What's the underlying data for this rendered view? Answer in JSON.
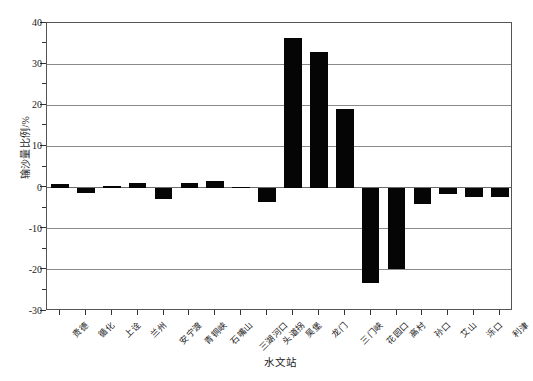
{
  "chart_data": {
    "type": "bar",
    "title": "",
    "xlabel": "水文站",
    "ylabel": "输沙量比例/%",
    "ylim": [
      -30,
      40
    ],
    "yticks": [
      -30,
      -20,
      -10,
      0,
      10,
      20,
      30,
      40
    ],
    "ytick_labels": [
      "-30",
      "-20",
      "-10",
      "0",
      "10",
      "20",
      "30",
      "40"
    ],
    "yminor_step": 5,
    "grid": "horizontal",
    "legend": "none",
    "bar_color": "#050505",
    "categories": [
      "贵德",
      "循化",
      "上诠",
      "兰州",
      "安宁渡",
      "青铜峡",
      "石嘴山",
      "三湖河口",
      "头道拐",
      "吴堡",
      "龙门",
      "三门峡",
      "花园口",
      "高村",
      "孙口",
      "艾山",
      "泺口",
      "利津"
    ],
    "values": [
      0.8,
      -1.4,
      0.5,
      1.0,
      -2.8,
      1.0,
      1.6,
      0.2,
      -3.5,
      36.3,
      32.9,
      19.1,
      -23.2,
      -19.8,
      -4.0,
      -1.6,
      -2.4,
      -2.3
    ]
  }
}
